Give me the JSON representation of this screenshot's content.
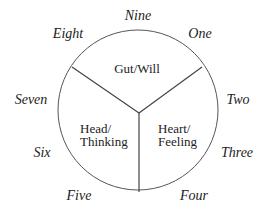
{
  "diagram": {
    "circle": {
      "cx": 138,
      "cy": 110,
      "r": 80,
      "stroke": "#555555"
    },
    "spokes": [
      {
        "name": "spoke-left",
        "x1": 139,
        "y1": 113,
        "x2": 72,
        "y2": 67
      },
      {
        "name": "spoke-right",
        "x1": 139,
        "y1": 113,
        "x2": 202,
        "y2": 67
      },
      {
        "name": "spoke-bottom",
        "x1": 139,
        "y1": 113,
        "x2": 139,
        "y2": 192
      }
    ],
    "centers": {
      "gut": {
        "line1": "Gut/Will"
      },
      "head": {
        "line1": "Head/",
        "line2": "Thinking"
      },
      "heart": {
        "line1": "Heart/",
        "line2": "Feeling"
      }
    },
    "types": {
      "nine": "Nine",
      "one": "One",
      "two": "Two",
      "three": "Three",
      "four": "Four",
      "five": "Five",
      "six": "Six",
      "seven": "Seven",
      "eight": "Eight"
    }
  }
}
